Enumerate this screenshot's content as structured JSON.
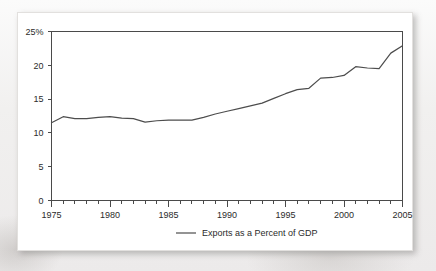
{
  "card": {
    "background_color": "#ffffff",
    "page_background_color": "#f2f1f0"
  },
  "chart_data": {
    "type": "line",
    "title": "",
    "subtitle": "",
    "xlabel": "",
    "ylabel": "",
    "grid": false,
    "legend_position": "bottom-center",
    "line_color": "#4d4d4d",
    "axis_color": "#4a4a4a",
    "xlim": [
      1975,
      2005
    ],
    "ylim": [
      0,
      25
    ],
    "y_tick_labels": [
      "0",
      "5",
      "10",
      "15",
      "20",
      "25%"
    ],
    "y_ticks": [
      0,
      5,
      10,
      15,
      20,
      25
    ],
    "x_tick_labels": [
      "1975",
      "1980",
      "1985",
      "1990",
      "1995",
      "2000",
      "2005"
    ],
    "x_ticks": [
      1975,
      1980,
      1985,
      1990,
      1995,
      2000,
      2005
    ],
    "x_minor_tick_step": 1,
    "series": [
      {
        "name": "Exports as a Percent of GDP",
        "x": [
          1975,
          1976,
          1977,
          1978,
          1979,
          1980,
          1981,
          1982,
          1983,
          1984,
          1985,
          1986,
          1987,
          1988,
          1989,
          1990,
          1991,
          1992,
          1993,
          1994,
          1995,
          1996,
          1997,
          1998,
          1999,
          2000,
          2001,
          2002,
          2003,
          2004,
          2005
        ],
        "values": [
          11.5,
          12.4,
          12.1,
          12.1,
          12.3,
          12.4,
          12.2,
          12.1,
          11.6,
          11.8,
          11.9,
          11.9,
          11.9,
          12.3,
          12.8,
          13.2,
          13.6,
          14.0,
          14.4,
          15.1,
          15.8,
          16.4,
          16.6,
          18.1,
          18.2,
          18.5,
          19.8,
          19.6,
          19.5,
          21.8,
          22.9
        ]
      }
    ],
    "legend": [
      {
        "label": "Exports as a Percent of GDP",
        "color": "#4d4d4d"
      }
    ]
  }
}
